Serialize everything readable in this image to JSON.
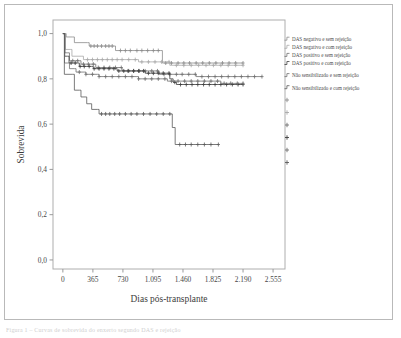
{
  "figure": {
    "caption_partial": "Figura 1 – Curvas de sobrevida do enxerto segundo DAS e rejeição"
  },
  "chart_data": {
    "type": "line",
    "title": "",
    "xlabel": "Dias pós-transplante",
    "ylabel": "Sobrevida",
    "xlim": [
      -120,
      2700
    ],
    "ylim": [
      -0.04,
      1.06
    ],
    "grid": false,
    "legend_position": "right",
    "xticks": [
      0,
      365,
      730,
      1095,
      1460,
      1825,
      2190,
      2555
    ],
    "xtick_labels": [
      "0",
      "365",
      "730",
      "1.095",
      "1.460",
      "1.825",
      "2.190",
      "2.555"
    ],
    "yticks": [
      0.0,
      0.2,
      0.4,
      0.6,
      0.8,
      1.0
    ],
    "ytick_labels": [
      "0,0",
      "0,2",
      "0,4",
      "0,6",
      "0,8",
      "1,0"
    ],
    "series": [
      {
        "name": "DAS negativo e sem rejeição",
        "color": "#8c8c8c",
        "points": [
          [
            0,
            1.0
          ],
          [
            30,
            1.0
          ],
          [
            40,
            0.985
          ],
          [
            120,
            0.985
          ],
          [
            140,
            0.96
          ],
          [
            300,
            0.96
          ],
          [
            320,
            0.945
          ],
          [
            620,
            0.945
          ],
          [
            640,
            0.925
          ],
          [
            1190,
            0.925
          ],
          [
            1210,
            0.87
          ],
          [
            2190,
            0.87
          ]
        ],
        "censor_x": [
          340,
          380,
          420,
          470,
          520,
          560,
          600,
          700,
          760,
          820,
          900,
          960,
          1030,
          1100,
          1160,
          1250,
          1320,
          1400,
          1470,
          1540,
          1620,
          1700,
          1780,
          1860,
          1940,
          2020,
          2100,
          2190
        ]
      },
      {
        "name": "DAS negativo e com rejeição",
        "color": "#a8a8a8",
        "points": [
          [
            0,
            1.0
          ],
          [
            20,
            1.0
          ],
          [
            30,
            0.93
          ],
          [
            90,
            0.93
          ],
          [
            110,
            0.9
          ],
          [
            230,
            0.9
          ],
          [
            250,
            0.885
          ],
          [
            900,
            0.885
          ],
          [
            920,
            0.875
          ],
          [
            1280,
            0.875
          ],
          [
            1300,
            0.86
          ],
          [
            2190,
            0.86
          ]
        ],
        "censor_x": [
          300,
          360,
          420,
          480,
          540,
          600,
          660,
          720,
          800,
          880,
          960,
          1040,
          1120,
          1200,
          1290,
          1380,
          1470,
          1560,
          1650,
          1740,
          1830,
          1920,
          2010,
          2100,
          2190
        ]
      },
      {
        "name": "DAS positivo e sem rejeição",
        "color": "#707070",
        "points": [
          [
            0,
            1.0
          ],
          [
            15,
            1.0
          ],
          [
            25,
            0.915
          ],
          [
            60,
            0.915
          ],
          [
            80,
            0.88
          ],
          [
            200,
            0.88
          ],
          [
            220,
            0.865
          ],
          [
            380,
            0.865
          ],
          [
            400,
            0.85
          ],
          [
            700,
            0.85
          ],
          [
            720,
            0.835
          ],
          [
            1150,
            0.835
          ],
          [
            1170,
            0.82
          ],
          [
            1600,
            0.82
          ],
          [
            1620,
            0.81
          ],
          [
            2420,
            0.81
          ]
        ],
        "censor_x": [
          120,
          180,
          250,
          310,
          370,
          430,
          500,
          570,
          640,
          710,
          790,
          860,
          930,
          1000,
          1080,
          1150,
          1230,
          1300,
          1380,
          1450,
          1530,
          1610,
          1690,
          1770,
          1850,
          1930,
          2010,
          2090,
          2170,
          2250,
          2330,
          2420
        ]
      },
      {
        "name": "DAS positivo e com rejeição",
        "color": "#3d3d3d",
        "points": [
          [
            0,
            1.0
          ],
          [
            12,
            1.0
          ],
          [
            22,
            0.9
          ],
          [
            55,
            0.9
          ],
          [
            75,
            0.87
          ],
          [
            180,
            0.87
          ],
          [
            200,
            0.855
          ],
          [
            350,
            0.855
          ],
          [
            370,
            0.845
          ],
          [
            640,
            0.845
          ],
          [
            660,
            0.835
          ],
          [
            980,
            0.835
          ],
          [
            1000,
            0.825
          ],
          [
            1280,
            0.825
          ],
          [
            1300,
            0.8
          ],
          [
            1340,
            0.785
          ],
          [
            1380,
            0.775
          ],
          [
            2190,
            0.775
          ]
        ],
        "censor_x": [
          100,
          150,
          210,
          260,
          320,
          380,
          440,
          500,
          560,
          620,
          680,
          740,
          800,
          860,
          920,
          980,
          1040,
          1100,
          1160,
          1220,
          1290,
          1360,
          1430,
          1500,
          1570,
          1640,
          1710,
          1780,
          1850,
          1920,
          1990,
          2060,
          2130,
          2190
        ]
      },
      {
        "name": "Não sensibilizado e sem rejeição",
        "color": "#6f6f6f",
        "points": [
          [
            0,
            1.0
          ],
          [
            10,
            1.0
          ],
          [
            20,
            0.87
          ],
          [
            60,
            0.87
          ],
          [
            80,
            0.845
          ],
          [
            140,
            0.845
          ],
          [
            160,
            0.83
          ],
          [
            260,
            0.83
          ],
          [
            280,
            0.82
          ],
          [
            420,
            0.82
          ],
          [
            440,
            0.81
          ],
          [
            900,
            0.81
          ],
          [
            920,
            0.8
          ],
          [
            1250,
            0.8
          ],
          [
            1270,
            0.79
          ],
          [
            1900,
            0.79
          ],
          [
            1920,
            0.78
          ],
          [
            2190,
            0.78
          ]
        ],
        "censor_x": [
          200,
          280,
          360,
          440,
          520,
          600,
          680,
          760,
          840,
          920,
          1000,
          1080,
          1160,
          1240,
          1320,
          1400,
          1480,
          1560,
          1640,
          1720,
          1800,
          1880,
          1960,
          2040,
          2120,
          2190
        ]
      },
      {
        "name": "Não sensibilizado e com rejeição",
        "color": "#5a5a5a",
        "points": [
          [
            0,
            1.0
          ],
          [
            8,
            1.0
          ],
          [
            18,
            0.82
          ],
          [
            120,
            0.82
          ],
          [
            140,
            0.75
          ],
          [
            200,
            0.75
          ],
          [
            220,
            0.72
          ],
          [
            270,
            0.72
          ],
          [
            290,
            0.69
          ],
          [
            330,
            0.69
          ],
          [
            350,
            0.665
          ],
          [
            420,
            0.665
          ],
          [
            440,
            0.645
          ],
          [
            1310,
            0.645
          ],
          [
            1330,
            0.585
          ],
          [
            1365,
            0.51
          ],
          [
            1890,
            0.51
          ]
        ],
        "censor_x": [
          470,
          520,
          570,
          630,
          690,
          760,
          830,
          900,
          980,
          1060,
          1140,
          1220,
          1300,
          1420,
          1490,
          1560,
          1640,
          1720,
          1800,
          1890
        ]
      }
    ]
  },
  "legend": {
    "entries": [
      {
        "label": "DAS negativo e sem rejeição",
        "marker": "step-line",
        "color": "#8c8c8c"
      },
      {
        "label": "DAS negativo e com rejeição",
        "marker": "step-line",
        "color": "#a8a8a8"
      },
      {
        "label": "DAS positivo e sem rejeição",
        "marker": "step-line",
        "color": "#707070"
      },
      {
        "label": "DAS positivo e com rejeição",
        "marker": "step-line",
        "color": "#3d3d3d"
      },
      {
        "label": "Não sensibilizado e sem rejeição",
        "marker": "step-line",
        "color": "#6f6f6f"
      },
      {
        "label": "Não sensibilizado e com rejeição",
        "marker": "step-line",
        "color": "#5a5a5a"
      }
    ],
    "censor_markers": [
      {
        "name": "censor-1",
        "color": "#8c8c8c"
      },
      {
        "name": "censor-2",
        "color": "#a8a8a8"
      },
      {
        "name": "censor-3",
        "color": "#707070"
      },
      {
        "name": "censor-4",
        "color": "#3d3d3d"
      },
      {
        "name": "censor-5",
        "color": "#6f6f6f"
      },
      {
        "name": "censor-6",
        "color": "#5a5a5a"
      }
    ]
  },
  "colors": {
    "frame": "#b9b9b9",
    "axis": "#9a9a9a",
    "plot_border": "#aeaeae",
    "text": "#474747",
    "background": "#ffffff"
  }
}
